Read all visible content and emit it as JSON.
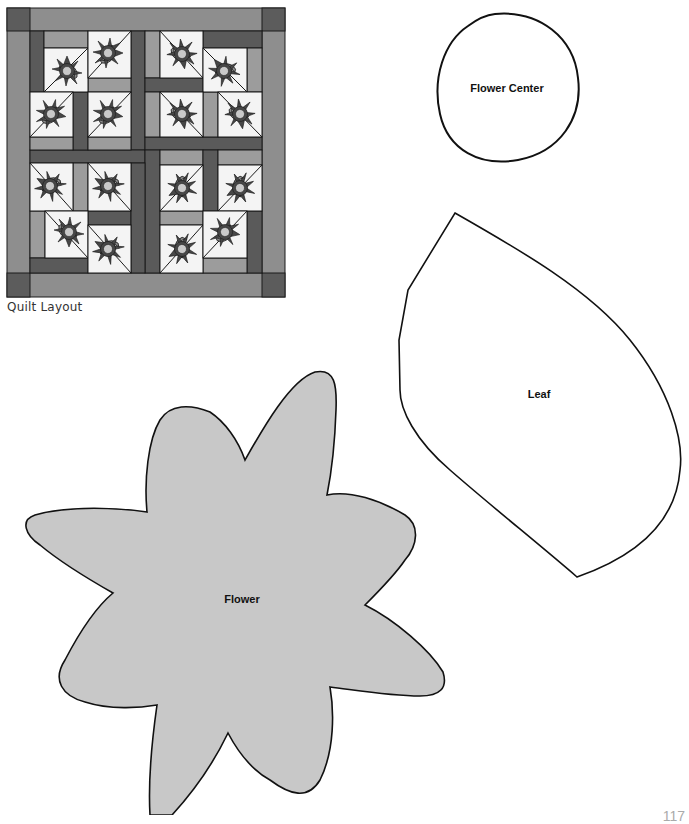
{
  "quilt_layout": {
    "caption": "Quilt Layout",
    "colors": {
      "corner": "#5c5c5c",
      "border": "#8e8e8e",
      "dark_strip": "#5a5a5a",
      "light_strip": "#9c9c9c",
      "block_bg": "#f4f4f4",
      "petal": "#474747",
      "flower_center": "#c9c9c9",
      "leaf": "#8c8c8c",
      "outline": "#1a1a1a"
    },
    "block_count": 16
  },
  "templates": {
    "flower_center": {
      "label": "Flower Center",
      "fill": "#ffffff"
    },
    "leaf": {
      "label": "Leaf",
      "fill": "#ffffff"
    },
    "flower": {
      "label": "Flower",
      "fill": "#c8c8c8"
    }
  },
  "page_number": "117"
}
